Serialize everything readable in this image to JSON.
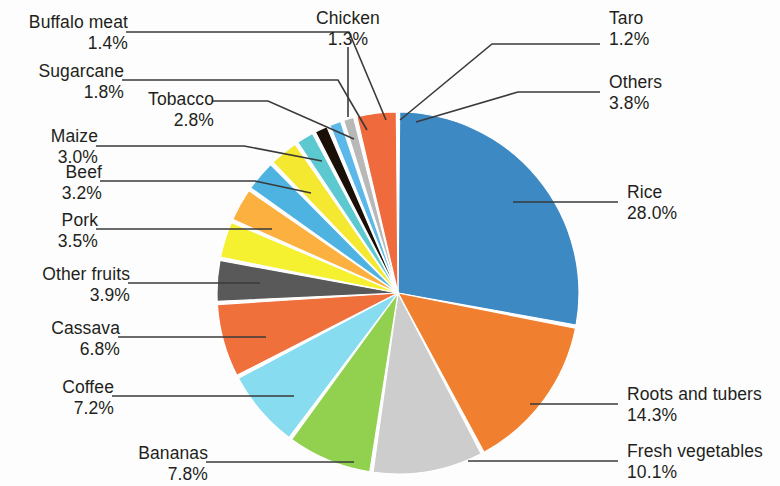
{
  "chart_data": {
    "type": "pie",
    "title": "",
    "subtitle": "",
    "xlabel": "",
    "ylabel": "",
    "legend_position": "callout-labels",
    "grid": false,
    "units": "percent",
    "start_angle_deg": 0,
    "direction": "clockwise",
    "categories": [
      "Rice",
      "Roots and tubers",
      "Fresh vegetables",
      "Bananas",
      "Coffee",
      "Cassava",
      "Other fruits",
      "Pork",
      "Beef",
      "Maize",
      "Tobacco",
      "Sugarcane",
      "Buffalo meat",
      "Chicken",
      "Taro",
      "Others"
    ],
    "values": [
      28.0,
      14.3,
      10.1,
      7.8,
      7.2,
      6.8,
      3.9,
      3.5,
      3.2,
      3.0,
      2.8,
      1.8,
      1.4,
      1.3,
      1.2,
      3.8
    ],
    "value_labels": [
      "28.0%",
      "14.3%",
      "10.1%",
      "7.8%",
      "7.2%",
      "6.8%",
      "3.9%",
      "3.5%",
      "3.2%",
      "3.0%",
      "2.8%",
      "1.8%",
      "1.4%",
      "1.3%",
      "1.2%",
      "3.8%"
    ],
    "colors": [
      "#3d89c4",
      "#f08030",
      "#cdcdcd",
      "#92d050",
      "#87dcf0",
      "#f0703c",
      "#595959",
      "#f5f030",
      "#fcb040",
      "#4eb3e0",
      "#f5e830",
      "#5cc8d0",
      "#1a1008",
      "#5bb8e8",
      "#b8b8b8",
      "#ef6a3c"
    ]
  },
  "labels": {
    "rice": {
      "category": "Rice",
      "percent": "28.0%"
    },
    "roots_and_tubers": {
      "category": "Roots and tubers",
      "percent": "14.3%"
    },
    "fresh_vegetables": {
      "category": "Fresh vegetables",
      "percent": "10.1%"
    },
    "bananas": {
      "category": "Bananas",
      "percent": "7.8%"
    },
    "coffee": {
      "category": "Coffee",
      "percent": "7.2%"
    },
    "cassava": {
      "category": "Cassava",
      "percent": "6.8%"
    },
    "other_fruits": {
      "category": "Other fruits",
      "percent": "3.9%"
    },
    "pork": {
      "category": "Pork",
      "percent": "3.5%"
    },
    "beef": {
      "category": "Beef",
      "percent": "3.2%"
    },
    "maize": {
      "category": "Maize",
      "percent": "3.0%"
    },
    "tobacco": {
      "category": "Tobacco",
      "percent": "2.8%"
    },
    "sugarcane": {
      "category": "Sugarcane",
      "percent": "1.8%"
    },
    "buffalo_meat": {
      "category": "Buffalo meat",
      "percent": "1.4%"
    },
    "chicken": {
      "category": "Chicken",
      "percent": "1.3%"
    },
    "taro": {
      "category": "Taro",
      "percent": "1.2%"
    },
    "others": {
      "category": "Others",
      "percent": "3.8%"
    }
  }
}
